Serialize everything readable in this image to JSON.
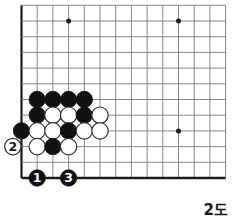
{
  "diagram": {
    "caption": "2도",
    "type": "go-board-corner",
    "board": {
      "origin_x": 21.5,
      "origin_y": 178.0,
      "spacing": 15.7,
      "cols": 13,
      "rows": 11,
      "line_color": "#7a7a7a",
      "edge_color": "#1a1a1a",
      "background": "#ffffff",
      "stone_radius": 8.2
    },
    "star_points": [
      {
        "col": 3,
        "row": 10
      },
      {
        "col": 10,
        "row": 10
      },
      {
        "col": 10,
        "row": 3
      }
    ],
    "stones": [
      {
        "col": 1,
        "row": 5,
        "color": "black"
      },
      {
        "col": 2,
        "row": 5,
        "color": "black"
      },
      {
        "col": 3,
        "row": 5,
        "color": "black"
      },
      {
        "col": 4,
        "row": 5,
        "color": "black"
      },
      {
        "col": 1,
        "row": 4,
        "color": "black"
      },
      {
        "col": 2,
        "row": 4,
        "color": "white"
      },
      {
        "col": 3,
        "row": 4,
        "color": "white"
      },
      {
        "col": 4,
        "row": 4,
        "color": "black"
      },
      {
        "col": 5,
        "row": 4,
        "color": "white"
      },
      {
        "col": 0,
        "row": 3,
        "color": "black"
      },
      {
        "col": 1,
        "row": 3,
        "color": "white"
      },
      {
        "col": 2,
        "row": 3,
        "color": "white"
      },
      {
        "col": 3,
        "row": 3,
        "color": "black"
      },
      {
        "col": 4,
        "row": 3,
        "color": "white"
      },
      {
        "col": 5,
        "row": 3,
        "color": "white"
      },
      {
        "col": 1,
        "row": 2,
        "color": "white"
      },
      {
        "col": 2,
        "row": 2,
        "color": "black"
      },
      {
        "col": 3,
        "row": 2,
        "color": "white"
      }
    ],
    "numbered_moves": [
      {
        "label": "1",
        "col": 1,
        "row": 0,
        "color": "black",
        "text_color": "#ffffff"
      },
      {
        "label": "2",
        "col": -0.55,
        "row": 2,
        "color": "white",
        "text_color": "#1a1a1a"
      },
      {
        "label": "3",
        "col": 3,
        "row": 0,
        "color": "black",
        "text_color": "#ffffff"
      }
    ]
  }
}
